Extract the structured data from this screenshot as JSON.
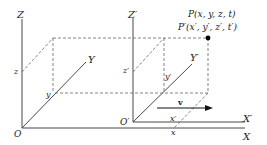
{
  "axes": {
    "origin": "O",
    "x": "X",
    "y": "Y",
    "z": "Z",
    "origin_prime": "O′",
    "x_prime": "X′",
    "y_prime": "Y′",
    "z_prime": "Z′"
  },
  "coordinates": {
    "z": "z",
    "y": "y",
    "x": "x",
    "z_prime": "z′",
    "y_prime": "y′",
    "x_prime": "x′"
  },
  "point": {
    "unprimed": "P(x, y, z, t)",
    "primed": "P′(x′, y′, z′, t′)"
  },
  "velocity": {
    "label": "v"
  },
  "colors": {
    "line": "#333333",
    "dashed": "#666666",
    "point": "#000000"
  }
}
